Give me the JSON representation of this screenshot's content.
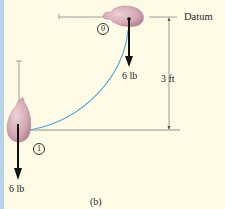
{
  "figure": {
    "caption": "(b)",
    "datum_label": "Datum",
    "height_label": "3 ft",
    "positions": [
      {
        "marker": "0",
        "weight_label": "6 lb"
      },
      {
        "marker": "1",
        "weight_label": "6 lb"
      }
    ]
  },
  "colors": {
    "background": "#fdfbe6",
    "left_strip": "#b9d3e6",
    "arc": "#5aa6d6",
    "bag_fill": "#d8b0bc",
    "bag_shade": "#b88a98",
    "lines": "#777777",
    "arrow": "#111111"
  }
}
